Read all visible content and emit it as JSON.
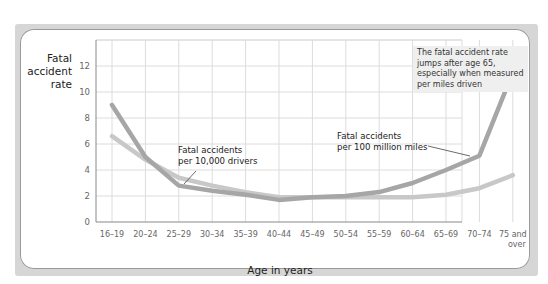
{
  "chart_data": {
    "type": "line",
    "title": "",
    "xlabel": "Age in years",
    "ylabel": "Fatal accident rate",
    "ylim": [
      0,
      14
    ],
    "yticks": [
      0,
      2,
      4,
      6,
      8,
      10,
      12
    ],
    "grid": true,
    "categories": [
      "16–19",
      "20–24",
      "25–29",
      "30–34",
      "35–39",
      "40–44",
      "45–49",
      "50–54",
      "55–59",
      "60–64",
      "65–69",
      "70–74",
      "75 and over"
    ],
    "series": [
      {
        "name": "Fatal accidents per 100 million miles",
        "color": "#a6a6a6",
        "values": [
          9.0,
          5.0,
          2.8,
          2.4,
          2.1,
          1.7,
          1.9,
          2.0,
          2.3,
          3.0,
          4.0,
          5.1,
          11.5
        ]
      },
      {
        "name": "Fatal accidents per 10,000 drivers",
        "color": "#c8c8c8",
        "values": [
          6.6,
          4.8,
          3.4,
          2.8,
          2.3,
          1.9,
          1.9,
          1.9,
          1.9,
          1.9,
          2.1,
          2.6,
          3.6
        ]
      }
    ],
    "annotations": [
      {
        "text": "Fatal accidents per 10,000 drivers",
        "points_to": "25–29"
      },
      {
        "text": "Fatal accidents per 100 million miles",
        "points_to": "70–74"
      },
      {
        "text": "The fatal accident rate jumps after age 65, especially when measured per miles driven",
        "boxed": true
      }
    ]
  },
  "labels": {
    "ylabel_lines": [
      "Fatal",
      "accident",
      "rate"
    ],
    "xtitle": "Age in years",
    "note": "The fatal accident rate jumps after age 65, especially when measured per miles driven",
    "ann_drivers_1": "Fatal accidents",
    "ann_drivers_2": "per 10,000 drivers",
    "ann_miles_1": "Fatal accidents",
    "ann_miles_2": "per 100 million miles",
    "last_cat_1": "75 and",
    "last_cat_2": "over"
  }
}
